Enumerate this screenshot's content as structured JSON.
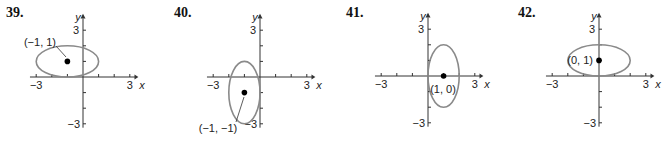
{
  "unit_px": 15.6,
  "colors": {
    "axis": "#333333",
    "ellipse": "#8a8a8a",
    "point": "#000000",
    "text": "#222222"
  },
  "chart_data": [
    {
      "number": "39.",
      "type": "ellipse-graph",
      "xlabel": "x",
      "ylabel": "y",
      "x_ticks_labeled": [
        "-3",
        "3"
      ],
      "y_ticks_labeled": [
        "3",
        "-3"
      ],
      "xlim": [
        -3,
        3
      ],
      "ylim": [
        -3,
        3
      ],
      "center": [
        -1,
        1
      ],
      "center_label": "(−1, 1)",
      "semi_axis_x": 2,
      "semi_axis_y": 1,
      "origin_px": [
        83,
        77
      ]
    },
    {
      "number": "40.",
      "type": "ellipse-graph",
      "xlabel": "x",
      "ylabel": "y",
      "x_ticks_labeled": [
        "-3",
        "3"
      ],
      "y_ticks_labeled": [
        "3",
        "-3"
      ],
      "xlim": [
        -3,
        3
      ],
      "ylim": [
        -3,
        3
      ],
      "center": [
        -1,
        -1
      ],
      "center_label": "(−1, −1)",
      "semi_axis_x": 1,
      "semi_axis_y": 2,
      "origin_px": [
        260,
        77
      ]
    },
    {
      "number": "41.",
      "type": "ellipse-graph",
      "xlabel": "x",
      "ylabel": "y",
      "x_ticks_labeled": [
        "-3",
        "3"
      ],
      "y_ticks_labeled": [
        "3",
        "-3"
      ],
      "xlim": [
        -3,
        3
      ],
      "ylim": [
        -3,
        3
      ],
      "center": [
        1,
        0
      ],
      "center_label": "(1, 0)",
      "semi_axis_x": 1,
      "semi_axis_y": 2,
      "origin_px": [
        428,
        76
      ]
    },
    {
      "number": "42.",
      "type": "ellipse-graph",
      "xlabel": "x",
      "ylabel": "y",
      "x_ticks_labeled": [
        "-3",
        "3"
      ],
      "y_ticks_labeled": [
        "3",
        "-3"
      ],
      "xlim": [
        -3,
        3
      ],
      "ylim": [
        -3,
        3
      ],
      "center": [
        0,
        1
      ],
      "center_label": "(0, 1)",
      "semi_axis_x": 2,
      "semi_axis_y": 1,
      "origin_px": [
        599,
        76
      ]
    }
  ]
}
